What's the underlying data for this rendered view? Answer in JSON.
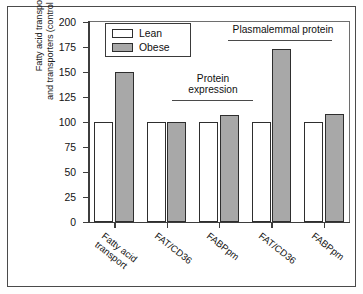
{
  "chart_data": {
    "type": "bar",
    "title": "",
    "xlabel": "",
    "ylabel": "Fatty acid transport and transporters (control = 100%)",
    "ylabel_line1": "Fatty acid transport",
    "ylabel_line2": "and transporters (control = 100%)",
    "ylim": [
      0,
      200
    ],
    "ytick_step": 25,
    "yticks": [
      "0",
      "25",
      "50",
      "75",
      "100",
      "125",
      "150",
      "175",
      "200"
    ],
    "ytick_values": [
      0,
      25,
      50,
      75,
      100,
      125,
      150,
      175,
      200
    ],
    "grid": false,
    "legend_position": "upper-left-inside",
    "categories": [
      "Fatty acid transport",
      "FAT/CD36",
      "FABPpm",
      "FAT/CD36",
      "FABPpm"
    ],
    "category_lines": [
      [
        "Fatty acid",
        "transport"
      ],
      [
        "FAT/CD36"
      ],
      [
        "FABPpm"
      ],
      [
        "FAT/CD36"
      ],
      [
        "FABPpm"
      ]
    ],
    "series": [
      {
        "name": "Lean",
        "color": "#ffffff",
        "values": [
          100,
          100,
          100,
          100,
          100
        ]
      },
      {
        "name": "Obese",
        "color": "#a8a8a8",
        "values": [
          150,
          100,
          107,
          173,
          108
        ]
      }
    ],
    "annotations": [
      {
        "text": "Protein expression",
        "line1": "Protein",
        "line2": "expression",
        "spans_categories": [
          2,
          3
        ]
      },
      {
        "text": "Plasmalemmal protein",
        "line1": "Plasmalemmal protein",
        "line2": "",
        "spans_categories": [
          4,
          5
        ]
      }
    ]
  },
  "legend": {
    "items": [
      {
        "label": "Lean",
        "swatch": "white-square-icon"
      },
      {
        "label": "Obese",
        "swatch": "gray-square-icon"
      }
    ]
  }
}
